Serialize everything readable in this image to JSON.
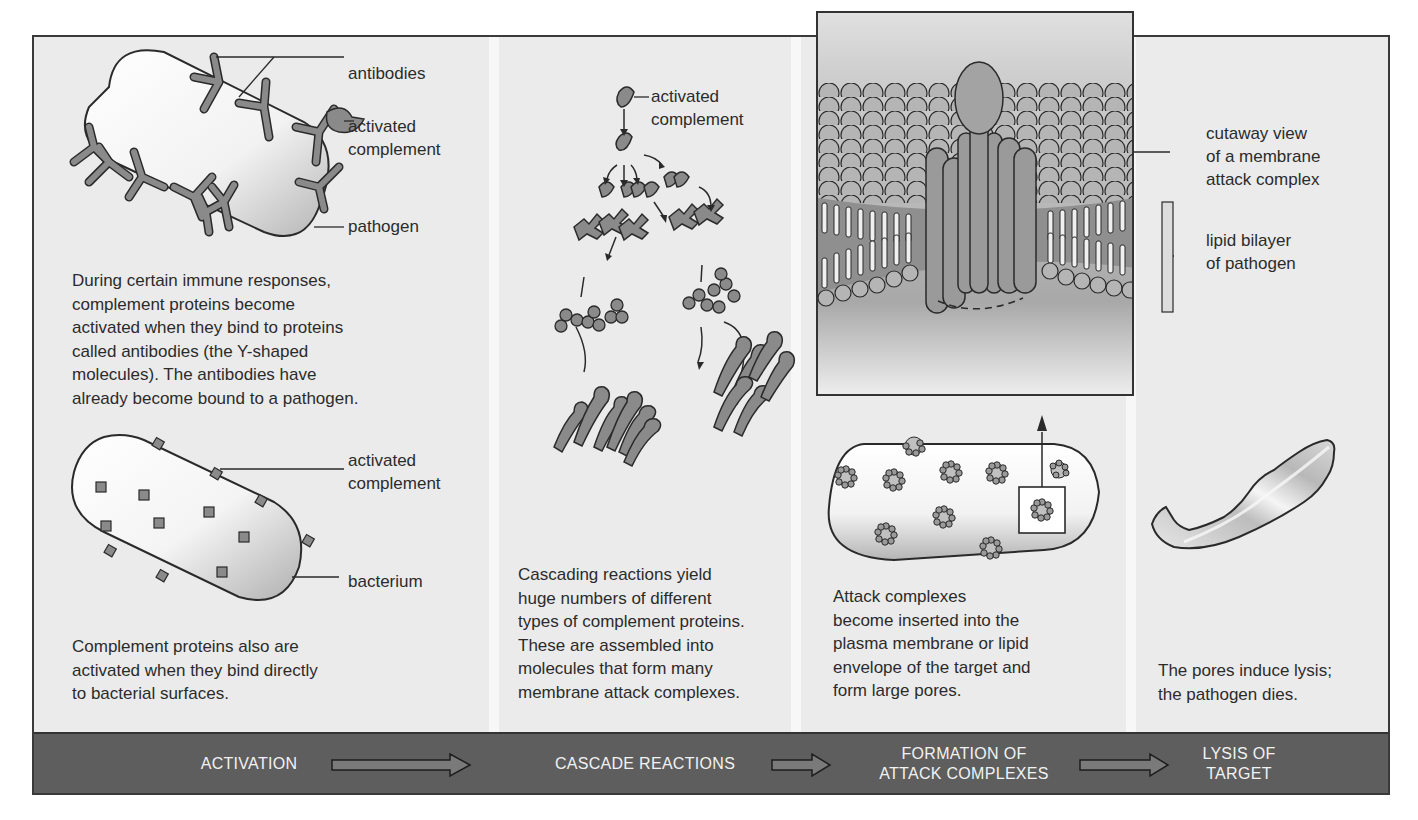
{
  "diagram": {
    "panels": [
      {
        "id": "activation",
        "labels": {
          "antibodies": "antibodies",
          "activated_complement_1": "activated\ncomplement",
          "pathogen": "pathogen",
          "activated_complement_2": "activated\ncomplement",
          "bacterium": "bacterium"
        },
        "caption_1": "During certain immune responses,\ncomplement proteins become\nactivated when they bind to proteins\ncalled antibodies (the Y-shaped\nmolecules). The antibodies have\nalready become bound to a pathogen.",
        "caption_2": "Complement proteins also are\nactivated when they bind directly\nto bacterial surfaces."
      },
      {
        "id": "cascade",
        "labels": {
          "activated_complement": "activated\ncomplement"
        },
        "caption": "Cascading reactions yield\nhuge numbers of different\ntypes of complement proteins.\nThese are assembled into\nmolecules that form many\nmembrane attack complexes."
      },
      {
        "id": "formation",
        "labels": {
          "cutaway": "cutaway view\nof a membrane\nattack complex",
          "lipid_bilayer": "lipid bilayer\nof pathogen"
        },
        "caption": "Attack complexes\nbecome inserted into the\nplasma membrane or lipid\nenvelope of the target and\nform large pores."
      },
      {
        "id": "lysis",
        "caption": "The pores induce lysis;\nthe pathogen dies."
      }
    ],
    "stages": [
      {
        "label": "ACTIVATION"
      },
      {
        "label": "CASCADE REACTIONS"
      },
      {
        "label": "FORMATION OF\nATTACK COMPLEXES"
      },
      {
        "label": "LYSIS OF\nTARGET"
      }
    ],
    "colors": {
      "panel_bg": "#ebebeb",
      "protein_fill": "#8a8a8a",
      "outline": "#2a2a2a",
      "stage_bar": "#5e5e5e",
      "stage_text": "#f2f2f2"
    }
  }
}
